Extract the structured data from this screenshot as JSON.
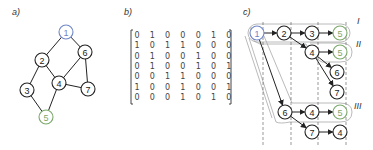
{
  "panels": {
    "a": {
      "label": "a)",
      "nodes": [
        {
          "id": "1",
          "x": 66,
          "y": 32,
          "color": "#6f86c8"
        },
        {
          "id": "2",
          "x": 42,
          "y": 60,
          "color": "#222222"
        },
        {
          "id": "6",
          "x": 85,
          "y": 52,
          "color": "#222222"
        },
        {
          "id": "4",
          "x": 59,
          "y": 83,
          "color": "#222222"
        },
        {
          "id": "7",
          "x": 88,
          "y": 89,
          "color": "#222222"
        },
        {
          "id": "3",
          "x": 27,
          "y": 90,
          "color": "#222222"
        },
        {
          "id": "5",
          "x": 46,
          "y": 117,
          "color": "#7aa86a"
        }
      ],
      "edges": [
        [
          "1",
          "2"
        ],
        [
          "1",
          "6"
        ],
        [
          "2",
          "3"
        ],
        [
          "2",
          "4"
        ],
        [
          "6",
          "4"
        ],
        [
          "6",
          "7"
        ],
        [
          "4",
          "7"
        ],
        [
          "4",
          "5"
        ],
        [
          "3",
          "5"
        ]
      ]
    },
    "b": {
      "label": "b)",
      "matrix": [
        [
          0,
          1,
          0,
          0,
          0,
          1,
          0
        ],
        [
          1,
          0,
          1,
          1,
          0,
          0,
          0
        ],
        [
          0,
          1,
          0,
          0,
          1,
          0,
          0
        ],
        [
          0,
          1,
          0,
          0,
          1,
          0,
          1
        ],
        [
          0,
          0,
          1,
          1,
          0,
          0,
          0
        ],
        [
          1,
          0,
          0,
          1,
          0,
          0,
          1
        ],
        [
          0,
          0,
          0,
          1,
          0,
          1,
          0
        ]
      ]
    },
    "c": {
      "label": "c)",
      "group_labels": [
        "I",
        "II",
        "III"
      ],
      "nodes": [
        {
          "key": "n1",
          "id": "1",
          "x": 257,
          "y": 33,
          "color": "#6f86c8"
        },
        {
          "key": "n2",
          "id": "2",
          "x": 284,
          "y": 33,
          "color": "#222222"
        },
        {
          "key": "n3",
          "id": "3",
          "x": 312,
          "y": 33,
          "color": "#222222"
        },
        {
          "key": "n5a",
          "id": "5",
          "x": 340,
          "y": 33,
          "color": "#7aa86a"
        },
        {
          "key": "n4a",
          "id": "4",
          "x": 312,
          "y": 52,
          "color": "#222222"
        },
        {
          "key": "n5b",
          "id": "5",
          "x": 340,
          "y": 52,
          "color": "#7aa86a"
        },
        {
          "key": "n6a",
          "id": "6",
          "x": 337,
          "y": 72,
          "color": "#222222"
        },
        {
          "key": "n7a",
          "id": "7",
          "x": 337,
          "y": 92,
          "color": "#222222"
        },
        {
          "key": "n6b",
          "id": "6",
          "x": 285,
          "y": 112,
          "color": "#222222"
        },
        {
          "key": "n4b",
          "id": "4",
          "x": 312,
          "y": 112,
          "color": "#222222"
        },
        {
          "key": "n5c",
          "id": "5",
          "x": 340,
          "y": 112,
          "color": "#7aa86a"
        },
        {
          "key": "n7b",
          "id": "7",
          "x": 312,
          "y": 132,
          "color": "#222222"
        },
        {
          "key": "n4c",
          "id": "4",
          "x": 340,
          "y": 132,
          "color": "#222222"
        }
      ],
      "arrows": [
        [
          "n1",
          "n2"
        ],
        [
          "n2",
          "n3"
        ],
        [
          "n3",
          "n5a"
        ],
        [
          "n2",
          "n4a"
        ],
        [
          "n4a",
          "n5b"
        ],
        [
          "n4a",
          "n6a"
        ],
        [
          "n4a",
          "n7a"
        ],
        [
          "n1",
          "n6b"
        ],
        [
          "n6b",
          "n4b"
        ],
        [
          "n4b",
          "n5c"
        ],
        [
          "n6b",
          "n7b"
        ],
        [
          "n7b",
          "n4c"
        ]
      ]
    }
  }
}
